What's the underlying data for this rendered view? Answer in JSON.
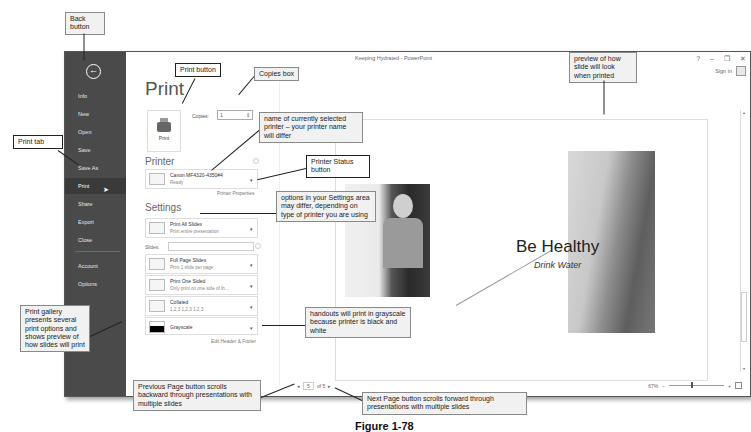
{
  "window": {
    "title": "Keeping Hydrated - PowerPoint",
    "controls": [
      "?",
      "–",
      "❐",
      "✕"
    ],
    "sign_in": "Sign in"
  },
  "backstage": {
    "back_icon": "back-arrow-icon",
    "items": [
      {
        "label": "Info"
      },
      {
        "label": "New"
      },
      {
        "label": "Open"
      },
      {
        "label": "Save"
      },
      {
        "label": "Save As"
      },
      {
        "label": "Print",
        "active": true
      },
      {
        "label": "Share"
      },
      {
        "label": "Export"
      },
      {
        "label": "Close"
      },
      {
        "label": "Account"
      },
      {
        "label": "Options"
      }
    ]
  },
  "print": {
    "heading": "Print",
    "print_button_label": "Print",
    "copies_label": "Copies:",
    "copies_value": "1",
    "printer_heading": "Printer",
    "printer_name": "Canon MF4320-4350#4",
    "printer_status": "Ready",
    "printer_properties": "Printer Properties",
    "settings_heading": "Settings",
    "slides_label": "Slides:",
    "slides_value": "",
    "settings": [
      {
        "title": "Print All Slides",
        "subtitle": "Print entire presentation"
      },
      {
        "title": "Full Page Slides",
        "subtitle": "Print 1 slide per page"
      },
      {
        "title": "Print One Sided",
        "subtitle": "Only print on one side of th..."
      },
      {
        "title": "Collated",
        "subtitle": "1,2,3    1,2,3    1,2,3"
      },
      {
        "title": "Grayscale",
        "subtitle": ""
      }
    ],
    "edit_header_footer": "Edit Header & Footer"
  },
  "preview": {
    "slide_title": "Be Healthy",
    "slide_subtitle": "Drink Water",
    "page_current": "5",
    "page_total_label": "of 5",
    "prev_icon": "◂",
    "next_icon": "▸",
    "zoom_level": "67%",
    "zoom_minus": "–",
    "zoom_plus": "+"
  },
  "callouts": {
    "back_button": "Back button",
    "print_button": "Print button",
    "copies_box": "Copies box",
    "print_tab": "Print tab",
    "printer_name": "name of currently selected printer – your printer name will differ",
    "printer_status": "Printer Status button",
    "settings_options": "options in your Settings area may differ, depending on type of printer you are using",
    "grayscale": "handouts will print in grayscale because printer is black and white",
    "print_gallery": "Print gallery presents several print options and shows preview of how slides will print",
    "previous_page": "Previous Page button scrolls backward through presentations with multiple slides",
    "next_page": "Next Page button scrolls forward through presentations with multiple slides",
    "preview": "preview of how slide will look when printed"
  },
  "caption": "Figure 1-78"
}
